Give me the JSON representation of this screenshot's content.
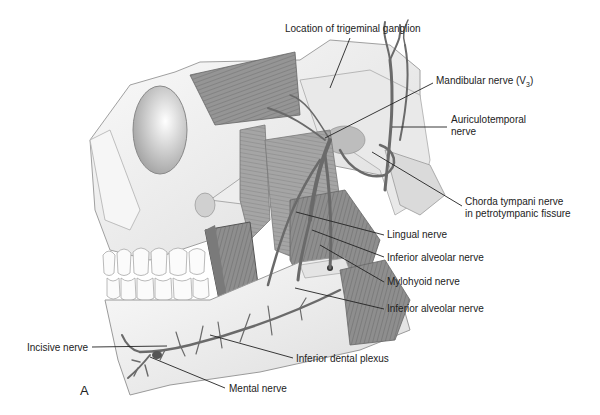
{
  "figure": {
    "panel_letter": "A",
    "labels": {
      "trigeminal_ganglion": "Location of trigeminal ganglion",
      "mandibular_nerve_prefix": "Mandibular nerve (V",
      "mandibular_nerve_sub": "3",
      "mandibular_nerve_suffix": ")",
      "auriculotemporal_line1": "Auriculotemporal",
      "auriculotemporal_line2": "nerve",
      "chorda_tympani_line1": "Chorda tympani nerve",
      "chorda_tympani_line2": "in petrotympanic fissure",
      "lingual_nerve": "Lingual nerve",
      "inferior_alveolar_upper": "Inferior alveolar nerve",
      "mylohyoid_nerve": "Mylohyoid nerve",
      "inferior_alveolar_lower": "Inferior alveolar nerve",
      "incisive_nerve": "Incisive nerve",
      "inferior_dental_plexus": "Inferior dental plexus",
      "mental_nerve": "Mental nerve"
    },
    "colors": {
      "bone": "#f2f2f2",
      "bone_outline": "#9a9a9a",
      "muscle": "#8a8a8a",
      "muscle_dark": "#6e6e6e",
      "nerve": "#6a6a6a",
      "leader_line": "#222222",
      "text": "#222222"
    }
  }
}
